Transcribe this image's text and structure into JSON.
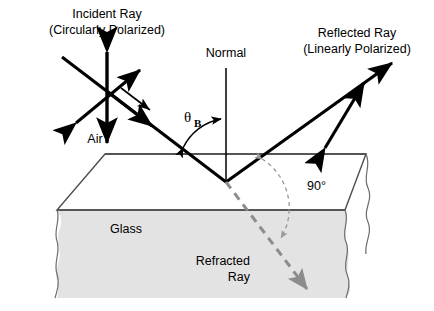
{
  "figure": {
    "title_incident_line1": "Incident Ray",
    "title_incident_line2": "(Circularly Polarized)",
    "title_normal": "Normal",
    "title_reflected_line1": "Reflected Ray",
    "title_reflected_line2": "(Linearly Polarized)",
    "label_air": "Air",
    "label_glass": "Glass",
    "label_refracted_line1": "Refracted",
    "label_refracted_line2": "Ray",
    "label_right_angle": "90°",
    "label_theta": "θ",
    "label_theta_subscript": "B"
  },
  "colors": {
    "ray_black": "#000000",
    "refracted_gray": "#8c8c8c",
    "arc_gray": "#9a9a9a",
    "glass_fill": "#e3e3e3",
    "glass_edge": "#4d4d4d",
    "surface_line": "#555555",
    "background": "#ffffff"
  },
  "geometry": {
    "incidence_point": [
      226,
      182
    ],
    "normal_top": [
      226,
      68
    ],
    "surface_y": 154,
    "incident_start": [
      62,
      57
    ],
    "reflected_end": [
      392,
      63
    ],
    "refracted_end": [
      307,
      289
    ],
    "angle_of_incidence_label": "θB",
    "reflected_refracted_angle": "90°"
  }
}
